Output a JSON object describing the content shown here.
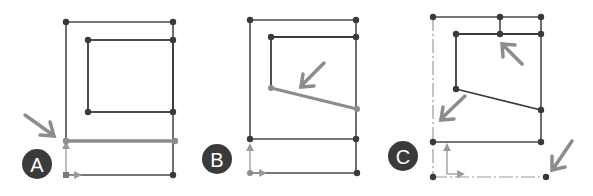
{
  "colors": {
    "line": "#4a4a4a",
    "highlight": "#8c8c8c",
    "label_bg": "#3a3a3a",
    "label_text": "#ffffff",
    "axis": "#9a9a9a"
  },
  "panels": [
    {
      "id": "A",
      "label": "A"
    },
    {
      "id": "B",
      "label": "B"
    },
    {
      "id": "C",
      "label": "C"
    }
  ]
}
